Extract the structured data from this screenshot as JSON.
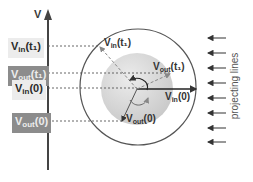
{
  "axis": {
    "label": "V"
  },
  "labels": [
    {
      "id": "vin_t1",
      "base": "V",
      "sub": "in",
      "arg": "(t₁)",
      "style": "in",
      "y": 37
    },
    {
      "id": "vout_t1",
      "base": "V",
      "sub": "out",
      "arg": "(t₁)",
      "style": "out",
      "y": 67
    },
    {
      "id": "vin_0",
      "base": "V",
      "sub": "in",
      "arg": "(0)",
      "style": "in",
      "y": 81
    },
    {
      "id": "vout_0",
      "base": "V",
      "sub": "out",
      "arg": "(0)",
      "style": "out",
      "y": 113
    }
  ],
  "vectors": {
    "vin_t1": {
      "base": "V",
      "sub": "in",
      "arg": "(t₁)"
    },
    "vout_t1": {
      "base": "V",
      "sub": "out",
      "arg": "(t₁)"
    },
    "vin_0": {
      "base": "V",
      "sub": "in",
      "arg": "(0)"
    },
    "vout_0": {
      "base": "V",
      "sub": "out",
      "arg": "(0)"
    }
  },
  "projecting": {
    "label": "projecting lines",
    "arrow_count": 8
  },
  "colors": {
    "axis": "#444444",
    "outer_circle": "#555555",
    "sphere_fill": "#d9d9d9",
    "dashed": "#555555",
    "in_box": "#ececec",
    "out_box": "#8c8c8c"
  }
}
